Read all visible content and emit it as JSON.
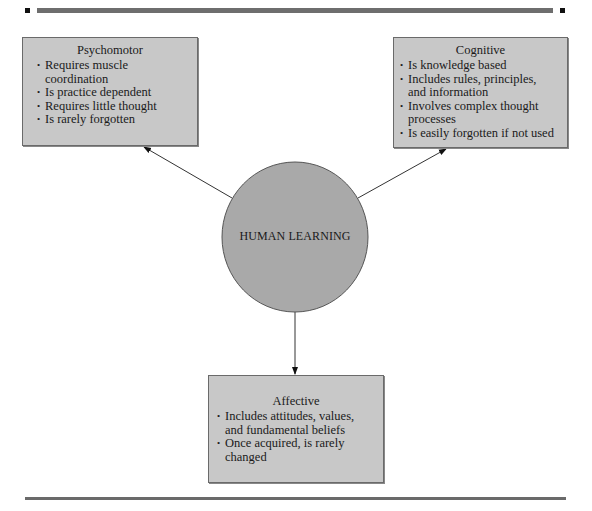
{
  "decorations": {
    "top_bar_color": "#6e6e6e",
    "bottom_rule_color": "#6a6a6a",
    "box_fill": "#c8c8c8",
    "circle_fill": "#a9a9a9"
  },
  "diagram": {
    "center": {
      "label": "HUMAN LEARNING"
    },
    "domains": [
      {
        "id": "psychomotor",
        "title": "Psychomotor",
        "items": [
          "Requires muscle coordination",
          "Is practice dependent",
          "Requires little thought",
          "Is rarely forgotten"
        ]
      },
      {
        "id": "cognitive",
        "title": "Cognitive",
        "items": [
          "Is knowledge based",
          "Includes rules, principles, and information",
          "Involves complex thought processes",
          "Is easily forgotten if not used"
        ]
      },
      {
        "id": "affective",
        "title": "Affective",
        "items": [
          "Includes attitudes, values, and fundamental beliefs",
          "Once acquired, is rarely changed"
        ]
      }
    ]
  }
}
